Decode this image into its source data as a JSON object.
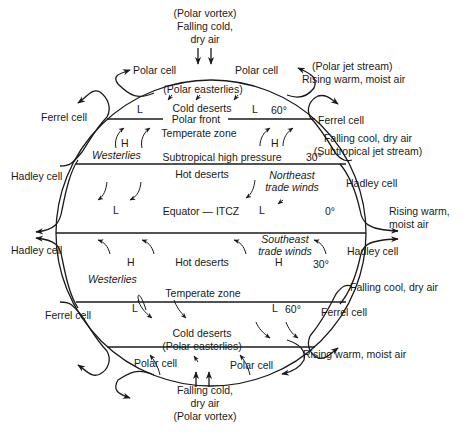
{
  "top": {
    "vortex_label": "(Polar vortex)",
    "falling_line1": "Falling cold,",
    "falling_line2": "dry air",
    "polar_cell_left": "Polar cell",
    "polar_cell_right": "Polar cell",
    "jet_stream": "(Polar  jet  stream)",
    "rising": "Rising warm, moist air",
    "ferrel_left": "Ferrel cell",
    "ferrel_right": "Ferrel cell",
    "falling_cool": "Falling cool, dry air",
    "subtropical_jet": "(Subtropical  jet  stream)"
  },
  "middle": {
    "hadley_nw": "Hadley cell",
    "hadley_ne": "Hadley cell",
    "hadley_sw": "Hadley cell",
    "hadley_se": "Hadley cell",
    "rising_line1": "Rising warm,",
    "rising_line2": "moist air"
  },
  "bottom": {
    "falling_cool": "Falling cool, dry air",
    "ferrel_left": "Ferrel cell",
    "ferrel_right": "Ferrel cell",
    "rising": "Rising warm, moist air",
    "polar_cell_left": "Polar cell",
    "polar_cell_right": "Polar cell",
    "falling_line1": "Falling cold,",
    "falling_line2": "dry air",
    "vortex_label": "(Polar vortex)"
  },
  "globe": {
    "north": {
      "polar_easterlies": "(Polar  easterlies)",
      "cold_deserts": "Cold deserts",
      "low_left": "L",
      "low_right": "L",
      "lat_60": "60°",
      "polar_front": "Polar  front",
      "temperate_zone": "Temperate zone",
      "high_left": "H",
      "high_right": "H",
      "westerlies": "Westerlies",
      "subtropical_high": "Subtropical high pressure",
      "lat_30": "30°",
      "hot_deserts": "Hot deserts",
      "ne_trade_line1": "Northeast",
      "ne_trade_line2": "trade winds",
      "low_eq_left": "L",
      "low_eq_right": "L"
    },
    "equator": {
      "label": "Equator — ITCZ",
      "lat_0": "0°"
    },
    "south": {
      "se_trade_line1": "Southeast",
      "se_trade_line2": "trade winds",
      "high_left": "H",
      "hot_deserts": "Hot deserts",
      "high_right": "H",
      "lat_30": "30°",
      "westerlies": "Westerlies",
      "temperate_zone": "Temperate zone",
      "low_left": "L",
      "low_right": "L",
      "lat_60": "60°",
      "cold_deserts": "Cold deserts",
      "polar_easterlies": "(Polar  easterlies)"
    }
  }
}
